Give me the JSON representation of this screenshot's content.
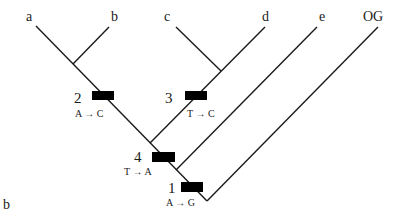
{
  "figure": {
    "panel_label": "b",
    "taxa": [
      "a",
      "b",
      "c",
      "d",
      "e",
      "OG"
    ],
    "mutations": [
      {
        "id": "1",
        "change": "A → G"
      },
      {
        "id": "2",
        "change": "A → C"
      },
      {
        "id": "3",
        "change": "T → C"
      },
      {
        "id": "4",
        "change": "T → A"
      }
    ]
  }
}
